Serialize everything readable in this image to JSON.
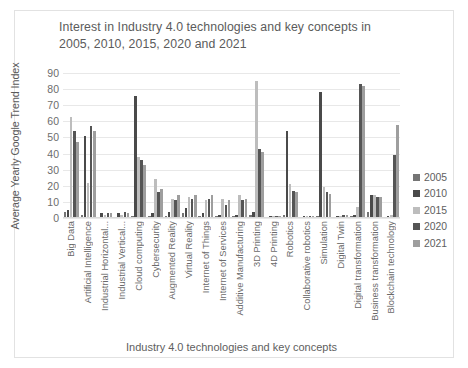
{
  "chart_data": {
    "type": "bar",
    "title": "Interest in Industry 4.0 technologies and key concepts in 2005, 2010, 2015, 2020 and 2021",
    "xlabel": "Industry 4.0 technologies and key concepts",
    "ylabel": "Average Yearly Google Trend Index",
    "ylim": [
      0,
      90
    ],
    "yticks": [
      0,
      10,
      20,
      30,
      40,
      50,
      60,
      70,
      80,
      90
    ],
    "grid": true,
    "legend_position": "right",
    "categories": [
      "Big Data",
      "Artificial Intelligence",
      "Industrial Horizontal...",
      "Industrial Vertical...",
      "Cloud computing",
      "Cybersecurity",
      "Augmented Reality",
      "Virtual Reality",
      "Internet of Things",
      "Internet of Services",
      "Additive Manufacturing",
      "3D Printing",
      "4D Printing",
      "Robotics",
      "Collaborative robotics",
      "Simulation",
      "Digital Twin",
      "Digital transformation",
      "Business transformation",
      "Blockchain technology"
    ],
    "series": [
      {
        "name": "2005",
        "color": "#757575",
        "values": [
          4,
          2,
          0,
          0,
          1,
          1,
          1,
          3,
          1,
          1,
          1,
          2,
          0,
          2,
          0,
          1,
          0,
          1,
          4,
          0
        ]
      },
      {
        "name": "2010",
        "color": "#4a4a4a",
        "values": [
          5,
          51,
          3,
          3,
          76,
          3,
          4,
          6,
          3,
          2,
          2,
          4,
          1,
          54,
          1,
          78,
          1,
          2,
          14,
          1
        ]
      },
      {
        "name": "2015",
        "color": "#bdbdbd",
        "values": [
          63,
          22,
          2,
          2,
          38,
          24,
          12,
          13,
          11,
          12,
          14,
          85,
          1,
          21,
          1,
          19,
          1,
          7,
          14,
          2
        ]
      },
      {
        "name": "2020",
        "color": "#555555",
        "values": [
          54,
          57,
          3,
          4,
          36,
          16,
          11,
          12,
          12,
          8,
          11,
          43,
          1,
          17,
          1,
          16,
          2,
          83,
          13,
          39
        ]
      },
      {
        "name": "2021",
        "color": "#9e9e9e",
        "values": [
          47,
          54,
          3,
          3,
          33,
          18,
          14,
          14,
          14,
          11,
          12,
          41,
          1,
          16,
          1,
          15,
          2,
          82,
          13,
          58
        ]
      }
    ]
  }
}
